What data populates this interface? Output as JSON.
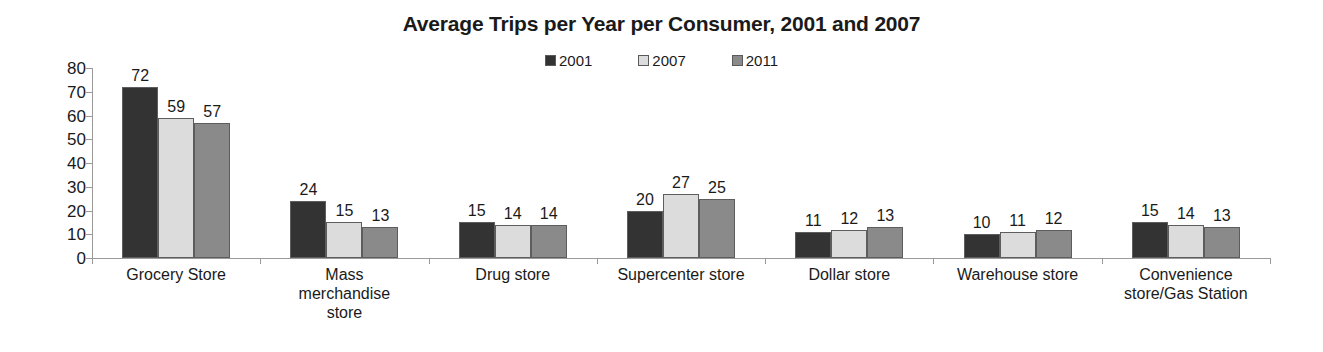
{
  "chart_data": {
    "type": "bar",
    "title": "Average Trips per Year per Consumer, 2001 and 2007",
    "xlabel": "",
    "ylabel": "",
    "ylim": [
      0,
      80
    ],
    "yticks": [
      80,
      70,
      60,
      50,
      40,
      30,
      20,
      10,
      0
    ],
    "grid": false,
    "legend_position": "top-center",
    "categories": [
      "Grocery Store",
      "Mass merchandise store",
      "Drug store",
      "Supercenter store",
      "Dollar store",
      "Warehouse store",
      "Convenience store/Gas Station"
    ],
    "category_lines": [
      [
        "Grocery Store"
      ],
      [
        "Mass",
        "merchandise",
        "store"
      ],
      [
        "Drug store"
      ],
      [
        "Supercenter store"
      ],
      [
        "Dollar store"
      ],
      [
        "Warehouse store"
      ],
      [
        "Convenience",
        "store/Gas Station"
      ]
    ],
    "series": [
      {
        "name": "2001",
        "color": "#333333",
        "values": [
          72,
          24,
          15,
          20,
          11,
          10,
          15
        ]
      },
      {
        "name": "2007",
        "color": "#dcdcdc",
        "values": [
          59,
          15,
          14,
          27,
          12,
          11,
          14
        ]
      },
      {
        "name": "2011",
        "color": "#8a8a8a",
        "values": [
          57,
          13,
          14,
          25,
          13,
          12,
          13
        ]
      }
    ]
  },
  "colors": {
    "axis": "#9a9a9a",
    "text": "#1a1a1a",
    "bar_border": "#5d5d5d",
    "background": "#ffffff"
  }
}
